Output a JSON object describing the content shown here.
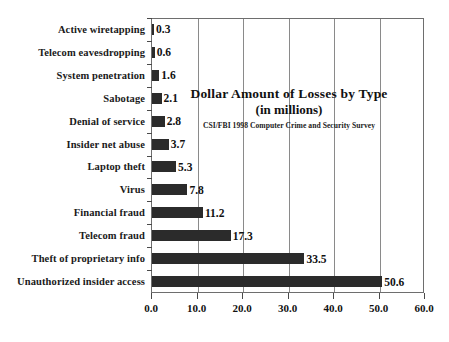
{
  "chart_data": {
    "type": "bar",
    "orientation": "horizontal",
    "title": "Dollar Amount of Losses by Type",
    "subtitle": "(in millions)",
    "source": "CSI/FBI 1998 Computer Crime and Security Survey",
    "xlabel": "",
    "ylabel": "",
    "xlim": [
      0.0,
      60.0
    ],
    "xticks": [
      "0.0",
      "10.0",
      "20.0",
      "30.0",
      "40.0",
      "50.0",
      "60.0"
    ],
    "xtick_values": [
      0,
      10,
      20,
      30,
      40,
      50,
      60
    ],
    "grid": "vertical",
    "legend": "none",
    "bar_color": "#2b2b2b",
    "categories": [
      "Active wiretapping",
      "Telecom eavesdropping",
      "System penetration",
      "Sabotage",
      "Denial of service",
      "Insider net abuse",
      "Laptop theft",
      "Virus",
      "Financial fraud",
      "Telecom fraud",
      "Theft of proprietary info",
      "Unauthorized insider access"
    ],
    "values": [
      0.3,
      0.6,
      1.6,
      2.1,
      2.8,
      3.7,
      5.3,
      7.8,
      11.2,
      17.3,
      33.5,
      50.6
    ],
    "value_labels": [
      "0.3",
      "0.6",
      "1.6",
      "2.1",
      "2.8",
      "3.7",
      "5.3",
      "7.8",
      "11.2",
      "17.3",
      "33.5",
      "50.6"
    ]
  }
}
